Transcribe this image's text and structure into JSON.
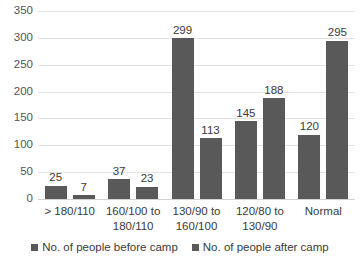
{
  "chart_data": {
    "type": "bar",
    "title": "",
    "subtitle": "",
    "xlabel": "",
    "ylabel": "",
    "grid": true,
    "legend_position": "bottom",
    "ylim": [
      0,
      350
    ],
    "ytick_step": 50,
    "yticks": [
      "350",
      "300",
      "250",
      "200",
      "150",
      "100",
      "50",
      "0"
    ],
    "ytick_values": [
      350,
      300,
      250,
      200,
      150,
      100,
      50,
      0
    ],
    "categories": [
      "> 180/110",
      "160/100 to 180/110",
      "130/90 to 160/100",
      "120/80 to 130/90",
      "Normal"
    ],
    "category_lines": [
      [
        "> 180/110"
      ],
      [
        "160/100 to",
        "180/110"
      ],
      [
        "130/90 to",
        "160/100"
      ],
      [
        "120/80 to",
        "130/90"
      ],
      [
        "Normal"
      ]
    ],
    "series": [
      {
        "name": "No. of people  before camp",
        "color": "#595959",
        "values": [
          25,
          37,
          299,
          145,
          120
        ],
        "labels": [
          "25",
          "37",
          "299",
          "145",
          "120"
        ]
      },
      {
        "name": "No. of people  after camp",
        "color": "#595959",
        "values": [
          7,
          23,
          113,
          188,
          295
        ],
        "labels": [
          "7",
          "23",
          "113",
          "188",
          "295"
        ]
      }
    ]
  },
  "legend": {
    "items": [
      {
        "label": "No. of people  before camp",
        "color": "#595959"
      },
      {
        "label": "No. of people  after camp",
        "color": "#595959"
      }
    ]
  },
  "colors": {
    "bar": "#595959",
    "gridline": "#e2e2e2",
    "axis_text": "#555555",
    "label_text": "#3a3a3a",
    "background": "#ffffff"
  }
}
